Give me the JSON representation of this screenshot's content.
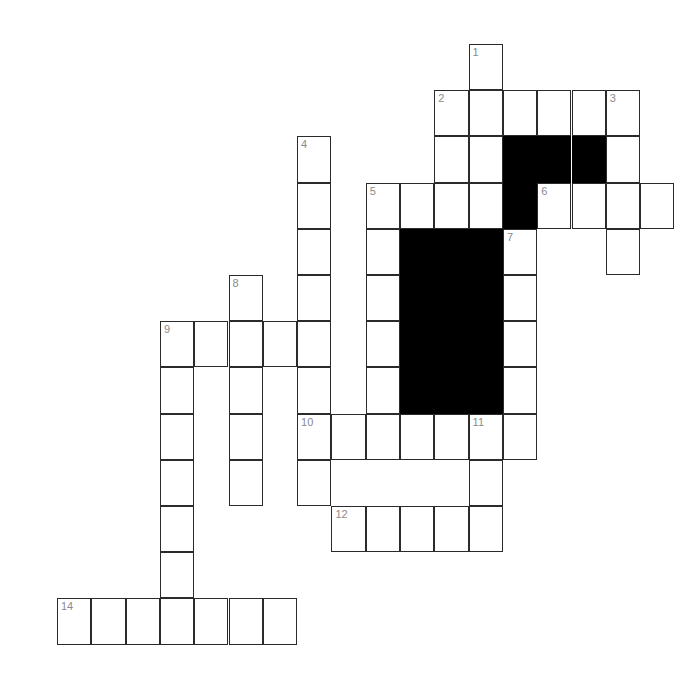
{
  "puzzle": {
    "title": "Crossword Grid",
    "background_color": "#ffffff",
    "cell_fill_color": "#ffffff",
    "block_fill_color": "#000000",
    "grid_line_color": "#2b2b2b",
    "number_color": "#8a8a8a",
    "geometry": {
      "origin_x": 57,
      "origin_y": 44,
      "cell_width": 34.3,
      "cell_height": 46.2,
      "columns": 20,
      "rows": 14
    },
    "clue_numbers": [
      "1",
      "2",
      "3",
      "4",
      "5",
      "6",
      "7",
      "8",
      "9",
      "10",
      "11",
      "12",
      "14"
    ],
    "cells": [
      {
        "col": 12,
        "row": 0,
        "num": "1",
        "letter": ""
      },
      {
        "col": 11,
        "row": 1,
        "num": "2",
        "letter": ""
      },
      {
        "col": 12,
        "row": 1,
        "num": "",
        "letter": ""
      },
      {
        "col": 13,
        "row": 1,
        "num": "",
        "letter": ""
      },
      {
        "col": 14,
        "row": 1,
        "num": "",
        "letter": ""
      },
      {
        "col": 15,
        "row": 1,
        "num": "",
        "letter": ""
      },
      {
        "col": 16,
        "row": 1,
        "num": "3",
        "letter": ""
      },
      {
        "col": 11,
        "row": 2,
        "num": "",
        "letter": ""
      },
      {
        "col": 12,
        "row": 2,
        "num": "",
        "letter": ""
      },
      {
        "col": 13,
        "row": 2,
        "block": true
      },
      {
        "col": 14,
        "row": 2,
        "block": true
      },
      {
        "col": 15,
        "row": 2,
        "block": true
      },
      {
        "col": 16,
        "row": 2,
        "num": "",
        "letter": ""
      },
      {
        "col": 7,
        "row": 2,
        "num": "4",
        "letter": ""
      },
      {
        "col": 7,
        "row": 3,
        "num": "",
        "letter": ""
      },
      {
        "col": 9,
        "row": 3,
        "num": "5",
        "letter": ""
      },
      {
        "col": 10,
        "row": 3,
        "num": "",
        "letter": ""
      },
      {
        "col": 11,
        "row": 3,
        "num": "",
        "letter": ""
      },
      {
        "col": 12,
        "row": 3,
        "num": "",
        "letter": ""
      },
      {
        "col": 13,
        "row": 3,
        "block": true
      },
      {
        "col": 14,
        "row": 3,
        "num": "6",
        "letter": ""
      },
      {
        "col": 15,
        "row": 3,
        "num": "",
        "letter": ""
      },
      {
        "col": 16,
        "row": 3,
        "num": "",
        "letter": ""
      },
      {
        "col": 17,
        "row": 3,
        "num": "",
        "letter": ""
      },
      {
        "col": 7,
        "row": 4,
        "num": "",
        "letter": ""
      },
      {
        "col": 9,
        "row": 4,
        "num": "",
        "letter": ""
      },
      {
        "col": 10,
        "row": 4,
        "block": true
      },
      {
        "col": 11,
        "row": 4,
        "block": true
      },
      {
        "col": 12,
        "row": 4,
        "block": true
      },
      {
        "col": 13,
        "row": 4,
        "num": "7",
        "letter": ""
      },
      {
        "col": 16,
        "row": 4,
        "num": "",
        "letter": ""
      },
      {
        "col": 7,
        "row": 5,
        "num": "",
        "letter": ""
      },
      {
        "col": 9,
        "row": 5,
        "num": "",
        "letter": ""
      },
      {
        "col": 10,
        "row": 5,
        "block": true
      },
      {
        "col": 11,
        "row": 5,
        "block": true
      },
      {
        "col": 12,
        "row": 5,
        "block": true
      },
      {
        "col": 13,
        "row": 5,
        "num": "",
        "letter": ""
      },
      {
        "col": 5,
        "row": 5,
        "num": "8",
        "letter": ""
      },
      {
        "col": 3,
        "row": 6,
        "num": "9",
        "letter": ""
      },
      {
        "col": 4,
        "row": 6,
        "num": "",
        "letter": ""
      },
      {
        "col": 5,
        "row": 6,
        "num": "",
        "letter": ""
      },
      {
        "col": 6,
        "row": 6,
        "num": "",
        "letter": ""
      },
      {
        "col": 7,
        "row": 6,
        "num": "",
        "letter": ""
      },
      {
        "col": 9,
        "row": 6,
        "num": "",
        "letter": ""
      },
      {
        "col": 10,
        "row": 6,
        "block": true
      },
      {
        "col": 11,
        "row": 6,
        "block": true
      },
      {
        "col": 12,
        "row": 6,
        "block": true
      },
      {
        "col": 13,
        "row": 6,
        "num": "",
        "letter": ""
      },
      {
        "col": 3,
        "row": 7,
        "num": "",
        "letter": ""
      },
      {
        "col": 5,
        "row": 7,
        "num": "",
        "letter": ""
      },
      {
        "col": 7,
        "row": 7,
        "num": "",
        "letter": ""
      },
      {
        "col": 9,
        "row": 7,
        "num": "",
        "letter": ""
      },
      {
        "col": 10,
        "row": 7,
        "block": true
      },
      {
        "col": 11,
        "row": 7,
        "block": true
      },
      {
        "col": 12,
        "row": 7,
        "block": true
      },
      {
        "col": 13,
        "row": 7,
        "num": "",
        "letter": ""
      },
      {
        "col": 3,
        "row": 8,
        "num": "",
        "letter": ""
      },
      {
        "col": 5,
        "row": 8,
        "num": "",
        "letter": ""
      },
      {
        "col": 7,
        "row": 8,
        "num": "10",
        "letter": ""
      },
      {
        "col": 8,
        "row": 8,
        "num": "",
        "letter": ""
      },
      {
        "col": 9,
        "row": 8,
        "num": "",
        "letter": ""
      },
      {
        "col": 10,
        "row": 8,
        "num": "",
        "letter": ""
      },
      {
        "col": 11,
        "row": 8,
        "num": "",
        "letter": ""
      },
      {
        "col": 12,
        "row": 8,
        "num": "11",
        "letter": ""
      },
      {
        "col": 13,
        "row": 8,
        "num": "",
        "letter": ""
      },
      {
        "col": 3,
        "row": 9,
        "num": "",
        "letter": ""
      },
      {
        "col": 5,
        "row": 9,
        "num": "",
        "letter": ""
      },
      {
        "col": 7,
        "row": 9,
        "num": "",
        "letter": ""
      },
      {
        "col": 12,
        "row": 9,
        "num": "",
        "letter": ""
      },
      {
        "col": 3,
        "row": 10,
        "num": "",
        "letter": ""
      },
      {
        "col": 8,
        "row": 10,
        "num": "12",
        "letter": ""
      },
      {
        "col": 9,
        "row": 10,
        "num": "",
        "letter": ""
      },
      {
        "col": 10,
        "row": 10,
        "num": "",
        "letter": ""
      },
      {
        "col": 11,
        "row": 10,
        "num": "",
        "letter": ""
      },
      {
        "col": 12,
        "row": 10,
        "num": "",
        "letter": ""
      },
      {
        "col": 3,
        "row": 11,
        "num": "",
        "letter": ""
      },
      {
        "col": 0,
        "row": 12,
        "num": "14",
        "letter": ""
      },
      {
        "col": 1,
        "row": 12,
        "num": "",
        "letter": ""
      },
      {
        "col": 2,
        "row": 12,
        "num": "",
        "letter": ""
      },
      {
        "col": 3,
        "row": 12,
        "num": "",
        "letter": ""
      },
      {
        "col": 4,
        "row": 12,
        "num": "",
        "letter": ""
      },
      {
        "col": 5,
        "row": 12,
        "num": "",
        "letter": ""
      },
      {
        "col": 6,
        "row": 12,
        "num": "",
        "letter": ""
      }
    ]
  }
}
